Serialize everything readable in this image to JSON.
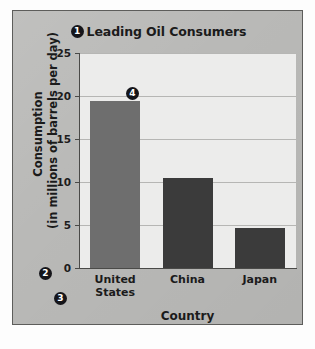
{
  "chart_data": {
    "type": "bar",
    "title": "Leading Oil Consumers",
    "xlabel": "Country",
    "ylabel": "Consumption (in millions of barrels per day)",
    "ylabel_line1": "Consumption",
    "ylabel_line2": "(in millions of barrels per day)",
    "categories": [
      "United States",
      "China",
      "Japan"
    ],
    "values": [
      19.4,
      10.5,
      4.6
    ],
    "ylim": [
      0,
      25
    ],
    "yticks": [
      0,
      5,
      10,
      15,
      20,
      25
    ],
    "ytick_labels": [
      "0",
      "5",
      "10",
      "15",
      "20",
      "25"
    ],
    "grid": true,
    "legend": "none",
    "bar_colors": [
      "#6e6e6e",
      "#3b3b3b",
      "#3b3b3b"
    ]
  },
  "callouts": [
    {
      "id": "1",
      "label": "1",
      "target": "chart-title"
    },
    {
      "id": "2",
      "label": "2",
      "target": "y-axis"
    },
    {
      "id": "3",
      "label": "3",
      "target": "x-axis-labels"
    },
    {
      "id": "4",
      "label": "4",
      "target": "bar-united-states"
    }
  ],
  "xtick_lines": [
    [
      "United",
      "States"
    ],
    [
      "China"
    ],
    [
      "Japan"
    ]
  ],
  "colors": {
    "card_background": "#b9b9b7",
    "plot_background": "#ececeb",
    "gridline": "#b6b6b4",
    "axis": "#4a4a48",
    "text": "#1b1b1b",
    "callout_background": "#15151a",
    "callout_text": "#ffffff"
  }
}
